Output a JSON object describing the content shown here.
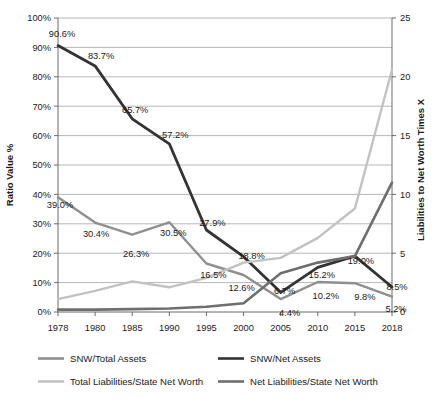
{
  "chart_data": {
    "type": "line",
    "title": "",
    "xlabel": "",
    "ylabel": "Ratio Value %",
    "y2label": "Liabilities to Net Worth Times X",
    "categories": [
      "1978",
      "1980",
      "1985",
      "1990",
      "1995",
      "2000",
      "2005",
      "2010",
      "2015",
      "2018"
    ],
    "ylim": [
      0,
      100
    ],
    "y2lim": [
      0,
      25
    ],
    "yticks": [
      "0%",
      "10%",
      "20%",
      "30%",
      "40%",
      "50%",
      "60%",
      "70%",
      "80%",
      "90%",
      "100%"
    ],
    "y2ticks": [
      "0",
      "5",
      "10",
      "15",
      "20",
      "25"
    ],
    "grid": true,
    "legend_position": "bottom",
    "series": [
      {
        "name": "SNW/Total Assets",
        "axis": "left",
        "color": "#8f8f8f",
        "values": [
          39.0,
          30.4,
          26.3,
          30.5,
          16.5,
          12.6,
          4.4,
          10.2,
          9.8,
          5.2
        ],
        "labels": [
          "39.0%",
          "30.4%",
          "26.3%",
          "30.5%",
          "16.5%",
          "12.6%",
          "4.4%",
          "10.2%",
          "9.8%",
          "5.2%"
        ]
      },
      {
        "name": "SNW/Net Assets",
        "axis": "left",
        "color": "#333333",
        "values": [
          90.6,
          83.7,
          65.7,
          57.2,
          27.9,
          18.8,
          6.7,
          15.2,
          19.0,
          8.5
        ],
        "labels": [
          "90.6%",
          "83.7%",
          "65.7%",
          "57.2%",
          "27.9%",
          "18.8%",
          "6.7%",
          "15.2%",
          "19.0%",
          "8.5%"
        ]
      },
      {
        "name": "Total Liabilities/State Net Worth",
        "axis": "right",
        "color": "#c2c2c2",
        "values": [
          1.1,
          1.8,
          2.6,
          2.1,
          2.9,
          4.2,
          4.6,
          6.3,
          8.8,
          20.6
        ],
        "labels": [
          "",
          "",
          "",
          "",
          "",
          "",
          "",
          "",
          "",
          ""
        ]
      },
      {
        "name": "Net Liabilities/State Net Worth",
        "axis": "right",
        "color": "#6e6e6e",
        "values": [
          0.2,
          0.2,
          0.25,
          0.3,
          0.45,
          0.75,
          3.3,
          4.2,
          4.75,
          11.0
        ],
        "labels": [
          "",
          "",
          "",
          "",
          "",
          "",
          "",
          "",
          "",
          ""
        ]
      }
    ]
  },
  "axes": {
    "left_title": "Ratio Value %",
    "right_title": "Liabilities to Net Worth Times X"
  },
  "legend": {
    "items": [
      {
        "label": "SNW/Total Assets",
        "color": "#8f8f8f"
      },
      {
        "label": "SNW/Net Assets",
        "color": "#333333"
      },
      {
        "label": "Total Liabilities/State Net Worth",
        "color": "#c2c2c2"
      },
      {
        "label": "Net Liabilities/State Net Worth",
        "color": "#6e6e6e"
      }
    ]
  }
}
